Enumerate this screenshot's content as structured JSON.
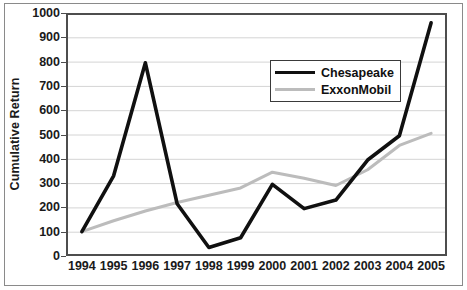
{
  "chart_data": {
    "type": "line",
    "title": "",
    "xlabel": "",
    "ylabel": "Cumulative Return",
    "categories": [
      "1994",
      "1995",
      "1996",
      "1997",
      "1998",
      "1999",
      "2000",
      "2001",
      "2002",
      "2003",
      "2004",
      "2005"
    ],
    "x": [
      1994,
      1995,
      1996,
      1997,
      1998,
      1999,
      2000,
      2001,
      2002,
      2003,
      2004,
      2005
    ],
    "series": [
      {
        "name": "Chesapeake",
        "color": "#101010",
        "values": [
          100,
          330,
          795,
          215,
          35,
          75,
          295,
          195,
          230,
          395,
          495,
          960
        ]
      },
      {
        "name": "ExxonMobil",
        "color": "#bcbcbc",
        "values": [
          100,
          145,
          185,
          220,
          250,
          280,
          345,
          320,
          290,
          355,
          455,
          505
        ]
      }
    ],
    "ylim": [
      0,
      1000
    ],
    "yticks": [
      0,
      100,
      200,
      300,
      400,
      500,
      600,
      700,
      800,
      900,
      1000
    ],
    "ytick_labels": [
      "0",
      "100",
      "200",
      "300",
      "400",
      "500",
      "600",
      "700",
      "800",
      "900",
      "1000"
    ],
    "grid": "horizontal",
    "grid_color": "#d4d4d4",
    "legend_position": "upper-right-inside",
    "axis_color": "#4d4d4d",
    "plot_border_color": "#4d4d4d",
    "background": "#ffffff"
  },
  "legend": {
    "entries": [
      {
        "label": "Chesapeake",
        "color": "#101010",
        "width": 3.6
      },
      {
        "label": "ExxonMobil",
        "color": "#bcbcbc",
        "width": 3.0
      }
    ]
  }
}
